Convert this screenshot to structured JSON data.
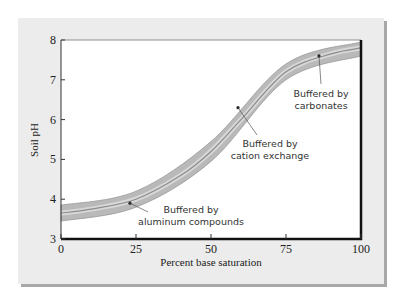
{
  "chart_data": {
    "type": "line",
    "title": "",
    "xlabel": "Percent base saturation",
    "ylabel": "Soil pH",
    "xlim": [
      0,
      100
    ],
    "ylim": [
      3,
      8
    ],
    "x_ticks": [
      "0",
      "25",
      "50",
      "75",
      "100"
    ],
    "y_ticks": [
      "3",
      "4",
      "5",
      "6",
      "7",
      "8"
    ],
    "grid": false,
    "series": [
      {
        "name": "Soil pH vs base saturation (band center)",
        "x": [
          0,
          10,
          25,
          40,
          50,
          60,
          75,
          90,
          100
        ],
        "y": [
          3.65,
          3.75,
          4.0,
          4.6,
          5.2,
          6.0,
          7.2,
          7.65,
          7.8
        ]
      },
      {
        "name": "Band upper bound",
        "x": [
          0,
          25,
          50,
          75,
          100
        ],
        "y": [
          3.85,
          4.2,
          5.45,
          7.4,
          7.95
        ]
      },
      {
        "name": "Band lower bound",
        "x": [
          0,
          25,
          50,
          75,
          100
        ],
        "y": [
          3.45,
          3.8,
          4.95,
          7.0,
          7.6
        ]
      }
    ],
    "annotations": [
      {
        "text_line1": "Buffered by",
        "text_line2": "aluminum compounds",
        "x": 23,
        "y": 3.9
      },
      {
        "text_line1": "Buffered by",
        "text_line2": "cation exchange",
        "x": 59,
        "y": 6.3
      },
      {
        "text_line1": "Buffered by",
        "text_line2": "carbonates",
        "x": 86,
        "y": 7.6
      }
    ]
  }
}
